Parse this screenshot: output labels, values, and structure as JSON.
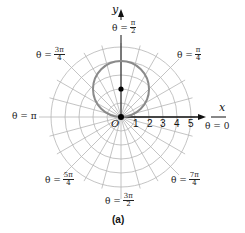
{
  "chart_data": {
    "type": "polar",
    "title": "",
    "caption": "(a)",
    "equation_plotted": "r = 4 sin θ (circle with center (0, 2), radius 2)",
    "circle": {
      "center_xy": [
        0,
        2
      ],
      "radius": 2,
      "color": "#888888"
    },
    "marked_point": {
      "x": 0,
      "y": 2,
      "color": "#000000"
    },
    "pole_label": "O",
    "radial_tick_labels": [
      "1",
      "2",
      "3",
      "4",
      "5"
    ],
    "r_max": 5,
    "ring_values": [
      1,
      2,
      3,
      4,
      5
    ],
    "radial_line_step_degrees": 15,
    "angle_labels": [
      {
        "angle_deg": 0,
        "prefix": "θ = ",
        "value": "0"
      },
      {
        "angle_deg": 45,
        "prefix": "θ = ",
        "num": "π",
        "den": "4"
      },
      {
        "angle_deg": 90,
        "prefix": "θ = ",
        "num": "π",
        "den": "2"
      },
      {
        "angle_deg": 135,
        "prefix": "θ = ",
        "num": "3π",
        "den": "4"
      },
      {
        "angle_deg": 180,
        "prefix": "θ = ",
        "value": "π"
      },
      {
        "angle_deg": 225,
        "prefix": "θ = ",
        "num": "5π",
        "den": "4"
      },
      {
        "angle_deg": 270,
        "prefix": "θ = ",
        "num": "3π",
        "den": "2"
      },
      {
        "angle_deg": 315,
        "prefix": "θ = ",
        "num": "7π",
        "den": "4"
      }
    ],
    "xlabel": "x",
    "ylabel": "y",
    "grid": true,
    "grid_color": "#b0b0b0"
  },
  "labels": {
    "x_axis": "x",
    "y_axis": "y",
    "pole": "O",
    "caption": "(a)",
    "theta_prefix": "θ = ",
    "theta_0": "θ = 0",
    "theta_pi": "θ = π",
    "ticks": [
      "1",
      "2",
      "3",
      "4",
      "5"
    ],
    "pi4": {
      "num": "π",
      "den": "4"
    },
    "pi2": {
      "num": "π",
      "den": "2"
    },
    "threepi4": {
      "num": "3π",
      "den": "4"
    },
    "fivepi4": {
      "num": "5π",
      "den": "4"
    },
    "threepi2": {
      "num": "3π",
      "den": "2"
    },
    "sevenpi4": {
      "num": "7π",
      "den": "4"
    }
  }
}
